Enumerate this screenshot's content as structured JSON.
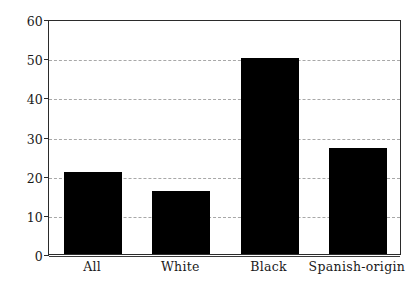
{
  "chart_data": {
    "type": "bar",
    "title": "",
    "subtitle": "",
    "xlabel": "",
    "ylabel": "",
    "categories": [
      "All",
      "White",
      "Black",
      "Spanish-origin"
    ],
    "values": [
      21,
      16,
      50,
      27
    ],
    "series": [
      {
        "name": "percent",
        "values": [
          21,
          16,
          50,
          27
        ]
      }
    ],
    "ylim": [
      0,
      60
    ],
    "yticks": [
      0,
      10,
      20,
      30,
      40,
      50,
      60
    ],
    "ytick_labels": [
      "0",
      "10",
      "20",
      "30",
      "40",
      "50",
      "60"
    ],
    "grid": "horizontal",
    "legend": "none",
    "bar_color": "#000000",
    "grid_color": "#9a9a9a",
    "axis_color": "#2b2b2b",
    "background": "#ffffff"
  }
}
